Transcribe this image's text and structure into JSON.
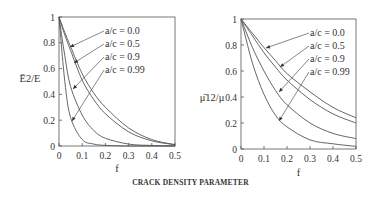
{
  "caption": "CRACK DENSITY PARAMETER",
  "chart_data": [
    {
      "type": "line",
      "title": "",
      "xlabel": "f",
      "ylabel": "Ē2/E",
      "xlim": [
        0,
        0.5
      ],
      "ylim": [
        0,
        1
      ],
      "xticks": [
        "0",
        "0.1",
        "0.2",
        "0.3",
        "0.4",
        "0.5"
      ],
      "yticks": [
        "0",
        "0.2",
        "0.4",
        "0.6",
        "0.8",
        "1"
      ],
      "x": [
        0,
        0.025,
        0.05,
        0.1,
        0.15,
        0.2,
        0.3,
        0.4,
        0.5
      ],
      "series": [
        {
          "name": "a/c = 0.0",
          "values": [
            1.0,
            0.88,
            0.77,
            0.56,
            0.41,
            0.3,
            0.14,
            0.05,
            0.01
          ]
        },
        {
          "name": "a/c = 0.5",
          "values": [
            1.0,
            0.86,
            0.74,
            0.51,
            0.36,
            0.25,
            0.11,
            0.04,
            0.01
          ]
        },
        {
          "name": "a/c = 0.9",
          "values": [
            1.0,
            0.7,
            0.46,
            0.24,
            0.12,
            0.06,
            0.015,
            0.004,
            0.0
          ]
        },
        {
          "name": "a/c = 0.99",
          "values": [
            1.0,
            0.5,
            0.22,
            0.05,
            0.015,
            0.005,
            0.0,
            0.0,
            0.0
          ]
        }
      ],
      "legend_position": "upper right (labels with arrows)",
      "grid": false
    },
    {
      "type": "line",
      "title": "",
      "xlabel": "f",
      "ylabel": "μ̄12/μ",
      "xlim": [
        0,
        0.5
      ],
      "ylim": [
        0,
        1
      ],
      "xticks": [
        "0",
        "0.1",
        "0.2",
        "0.3",
        "0.4",
        "0.5"
      ],
      "yticks": [
        "0",
        "0.2",
        "0.4",
        "0.6",
        "0.8",
        "1"
      ],
      "x": [
        0,
        0.05,
        0.1,
        0.15,
        0.2,
        0.3,
        0.4,
        0.5
      ],
      "series": [
        {
          "name": "a/c = 0.0",
          "values": [
            1.0,
            0.89,
            0.78,
            0.68,
            0.58,
            0.44,
            0.32,
            0.24
          ]
        },
        {
          "name": "a/c = 0.5",
          "values": [
            1.0,
            0.87,
            0.74,
            0.63,
            0.53,
            0.38,
            0.27,
            0.2
          ]
        },
        {
          "name": "a/c = 0.9",
          "values": [
            1.0,
            0.78,
            0.6,
            0.45,
            0.34,
            0.2,
            0.12,
            0.08
          ]
        },
        {
          "name": "a/c = 0.99",
          "values": [
            1.0,
            0.66,
            0.42,
            0.26,
            0.17,
            0.07,
            0.04,
            0.02
          ]
        }
      ],
      "legend_position": "upper right (labels with arrows)",
      "grid": false
    }
  ]
}
